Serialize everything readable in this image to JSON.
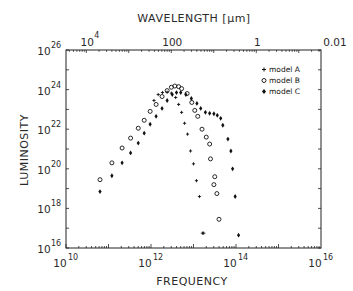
{
  "chart_data": {
    "type": "scatter",
    "title": "",
    "xlabel": "FREQUENCY",
    "ylabel": "LUMINOSITY",
    "top_xlabel": "WAVELENGTH [μm]",
    "xscale": "log",
    "yscale": "log",
    "xlim_log10": [
      10,
      16
    ],
    "ylim_log10": [
      16,
      26
    ],
    "x_ticks": [
      {
        "base": "10",
        "exp": "10",
        "log": 10
      },
      {
        "base": "10",
        "exp": "12",
        "log": 12
      },
      {
        "base": "10",
        "exp": "14",
        "log": 14
      },
      {
        "base": "10",
        "exp": "16",
        "log": 16
      }
    ],
    "y_ticks": [
      {
        "base": "10",
        "exp": "16",
        "log": 16
      },
      {
        "base": "10",
        "exp": "18",
        "log": 18
      },
      {
        "base": "10",
        "exp": "20",
        "log": 20
      },
      {
        "base": "10",
        "exp": "22",
        "log": 22
      },
      {
        "base": "10",
        "exp": "24",
        "log": 24
      },
      {
        "base": "10",
        "exp": "26",
        "log": 26
      }
    ],
    "top_ticks": [
      {
        "label": "10",
        "exp": "4",
        "log_freq": 10.5
      },
      {
        "label": "100",
        "exp": "",
        "log_freq": 12.5
      },
      {
        "label": "1",
        "exp": "",
        "log_freq": 14.5
      },
      {
        "label": "0.01",
        "exp": "",
        "log_freq": 16.5
      }
    ],
    "grid": false,
    "legend_position": "upper right",
    "series": [
      {
        "name": "model A",
        "marker": "plus",
        "points_log10": [
          [
            12.07,
            23.45
          ],
          [
            12.17,
            23.75
          ],
          [
            12.27,
            23.85
          ],
          [
            12.38,
            23.87
          ],
          [
            12.48,
            23.82
          ],
          [
            12.58,
            23.6
          ],
          [
            12.65,
            23.25
          ],
          [
            12.72,
            22.85
          ],
          [
            12.79,
            22.3
          ],
          [
            12.86,
            21.75
          ],
          [
            12.93,
            20.9
          ],
          [
            13.0,
            20.25
          ],
          [
            13.07,
            19.4
          ],
          [
            13.14,
            18.6
          ],
          [
            13.21,
            16.75
          ],
          [
            13.24,
            16.75
          ]
        ]
      },
      {
        "name": "model B",
        "marker": "open-circle",
        "points_log10": [
          [
            10.8,
            19.45
          ],
          [
            11.08,
            20.3
          ],
          [
            11.32,
            21.05
          ],
          [
            11.52,
            21.55
          ],
          [
            11.7,
            22.05
          ],
          [
            11.84,
            22.45
          ],
          [
            11.98,
            22.9
          ],
          [
            12.12,
            23.25
          ],
          [
            12.26,
            23.65
          ],
          [
            12.38,
            23.95
          ],
          [
            12.48,
            24.12
          ],
          [
            12.56,
            24.18
          ],
          [
            12.65,
            24.15
          ],
          [
            12.72,
            24.05
          ],
          [
            12.85,
            23.8
          ],
          [
            12.96,
            23.35
          ],
          [
            13.03,
            22.95
          ],
          [
            13.1,
            22.65
          ],
          [
            13.2,
            22.0
          ],
          [
            13.3,
            21.6
          ],
          [
            13.38,
            21.25
          ],
          [
            13.4,
            20.5
          ],
          [
            13.5,
            19.6
          ],
          [
            13.48,
            19.2
          ],
          [
            13.55,
            18.75
          ],
          [
            13.6,
            17.45
          ]
        ]
      },
      {
        "name": "model C",
        "marker": "filled-diamond",
        "points_log10": [
          [
            10.8,
            18.85
          ],
          [
            11.08,
            19.65
          ],
          [
            11.32,
            20.3
          ],
          [
            11.52,
            20.8
          ],
          [
            11.7,
            21.3
          ],
          [
            11.84,
            21.8
          ],
          [
            11.98,
            22.25
          ],
          [
            12.12,
            22.65
          ],
          [
            12.26,
            23.05
          ],
          [
            12.38,
            23.45
          ],
          [
            12.5,
            23.75
          ],
          [
            12.6,
            23.85
          ],
          [
            12.7,
            23.85
          ],
          [
            12.82,
            23.75
          ],
          [
            12.95,
            23.55
          ],
          [
            13.08,
            23.3
          ],
          [
            13.17,
            23.05
          ],
          [
            13.28,
            22.85
          ],
          [
            13.38,
            22.8
          ],
          [
            13.48,
            22.78
          ],
          [
            13.56,
            22.7
          ],
          [
            13.64,
            22.55
          ],
          [
            13.69,
            22.2
          ],
          [
            13.81,
            21.5
          ],
          [
            13.88,
            20.9
          ],
          [
            13.92,
            20.0
          ],
          [
            13.98,
            18.6
          ],
          [
            14.06,
            16.65
          ]
        ]
      }
    ]
  },
  "legend": {
    "items": [
      {
        "label": "model A",
        "marker": "plus"
      },
      {
        "label": "model B",
        "marker": "open-circle"
      },
      {
        "label": "model C",
        "marker": "filled-diamond"
      }
    ]
  },
  "colors": {
    "ink": "#1a1a1a",
    "background": "#ffffff"
  }
}
